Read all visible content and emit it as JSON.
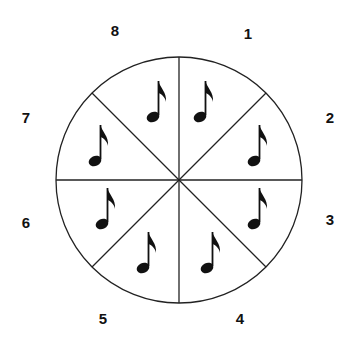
{
  "diagram": {
    "center": [
      179,
      180
    ],
    "radius": 123,
    "segments": 8,
    "line_color": "#222222",
    "labels": [
      {
        "text": "1",
        "x": 248,
        "y": 33
      },
      {
        "text": "2",
        "x": 330,
        "y": 117
      },
      {
        "text": "3",
        "x": 330,
        "y": 219
      },
      {
        "text": "4",
        "x": 240,
        "y": 318
      },
      {
        "text": "5",
        "x": 103,
        "y": 318
      },
      {
        "text": "6",
        "x": 26,
        "y": 222
      },
      {
        "text": "7",
        "x": 26,
        "y": 117
      },
      {
        "text": "8",
        "x": 115,
        "y": 30
      }
    ],
    "notes": [
      {
        "segment": "1",
        "icon": "eighth-note-icon",
        "x": 200,
        "y": 117
      },
      {
        "segment": "2",
        "icon": "eighth-note-icon",
        "x": 254,
        "y": 161
      },
      {
        "segment": "3",
        "icon": "eighth-note-icon",
        "x": 254,
        "y": 224
      },
      {
        "segment": "4",
        "icon": "eighth-note-icon",
        "x": 207,
        "y": 268
      },
      {
        "segment": "5",
        "icon": "eighth-note-icon",
        "x": 143,
        "y": 268
      },
      {
        "segment": "6",
        "icon": "eighth-note-icon",
        "x": 102,
        "y": 224
      },
      {
        "segment": "7",
        "icon": "eighth-note-icon",
        "x": 95,
        "y": 161
      },
      {
        "segment": "8",
        "icon": "eighth-note-icon",
        "x": 153,
        "y": 117
      }
    ]
  }
}
